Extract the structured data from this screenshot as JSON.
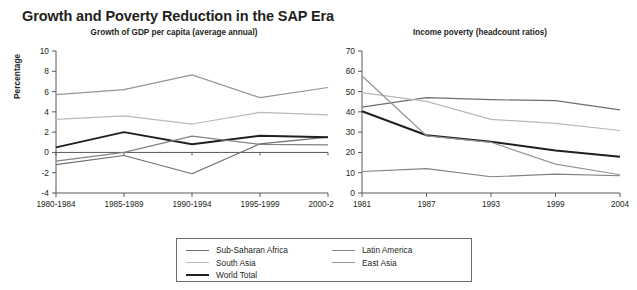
{
  "title": "Growth and Poverty Reduction in the SAP Era",
  "colors": {
    "sub_saharan_africa": "#6d6e71",
    "south_asia": "#b8b9bb",
    "world_total": "#231f20",
    "latin_america": "#808285",
    "east_asia": "#939598",
    "axis": "#58595b",
    "text": "#231f20"
  },
  "legend": {
    "items": [
      {
        "label": "Sub-Saharan Africa",
        "color": "#6d6e71",
        "width": 1.8
      },
      {
        "label": "South Asia",
        "color": "#b8b9bb",
        "width": 1.8
      },
      {
        "label": "World Total",
        "color": "#231f20",
        "width": 2.6
      },
      {
        "label": "Latin America",
        "color": "#808285",
        "width": 1.8
      },
      {
        "label": "East Asia",
        "color": "#939598",
        "width": 1.8
      }
    ],
    "columns": [
      [
        "Sub-Saharan Africa",
        "South Asia",
        "World Total"
      ],
      [
        "Latin America",
        "East Asia"
      ]
    ]
  },
  "chart_data": [
    {
      "type": "line",
      "title": "Growth of GDP per capita (average annual)",
      "xlabel": "",
      "ylabel": "Percentage",
      "categories": [
        "1980-1984",
        "1985-1989",
        "1990-1994",
        "1995-1999",
        "2000-2004"
      ],
      "ylim": [
        -4,
        10
      ],
      "yticks": [
        -4,
        -2,
        0,
        2,
        4,
        6,
        8,
        10
      ],
      "grid": false,
      "zero_line": true,
      "legend_position": "bottom-center-shared",
      "series": [
        {
          "name": "Sub-Saharan Africa",
          "color": "#6d6e71",
          "values": [
            -1.2,
            -0.3,
            -2.1,
            0.85,
            1.5
          ]
        },
        {
          "name": "South Asia",
          "color": "#b8b9bb",
          "values": [
            3.25,
            3.6,
            2.8,
            3.95,
            3.7
          ]
        },
        {
          "name": "World Total",
          "color": "#231f20",
          "values": [
            0.5,
            2.0,
            0.8,
            1.65,
            1.5
          ]
        },
        {
          "name": "Latin America",
          "color": "#808285",
          "values": [
            -0.85,
            0.0,
            1.6,
            0.8,
            0.75
          ]
        },
        {
          "name": "East Asia",
          "color": "#939598",
          "values": [
            5.7,
            6.2,
            7.65,
            5.4,
            6.4
          ]
        }
      ]
    },
    {
      "type": "line",
      "title": "Income poverty (headcount ratios)",
      "xlabel": "",
      "ylabel": "",
      "categories": [
        "1981",
        "1987",
        "1993",
        "1999",
        "2004"
      ],
      "ylim": [
        0,
        70
      ],
      "yticks": [
        0,
        10,
        20,
        30,
        40,
        50,
        60,
        70
      ],
      "grid": false,
      "zero_line": false,
      "legend_position": "bottom-center-shared",
      "series": [
        {
          "name": "Sub-Saharan Africa",
          "color": "#6d6e71",
          "values": [
            42.3,
            47.0,
            46.0,
            45.5,
            41.0
          ]
        },
        {
          "name": "South Asia",
          "color": "#b8b9bb",
          "values": [
            49.5,
            45.2,
            36.3,
            34.3,
            30.8
          ]
        },
        {
          "name": "World Total",
          "color": "#231f20",
          "values": [
            40.3,
            28.5,
            25.3,
            21.0,
            17.9
          ]
        },
        {
          "name": "Latin America",
          "color": "#808285",
          "values": [
            10.6,
            12.0,
            8.0,
            9.3,
            8.5
          ]
        },
        {
          "name": "East Asia",
          "color": "#939598",
          "values": [
            57.7,
            28.2,
            25.0,
            14.2,
            9.0
          ]
        }
      ]
    }
  ]
}
